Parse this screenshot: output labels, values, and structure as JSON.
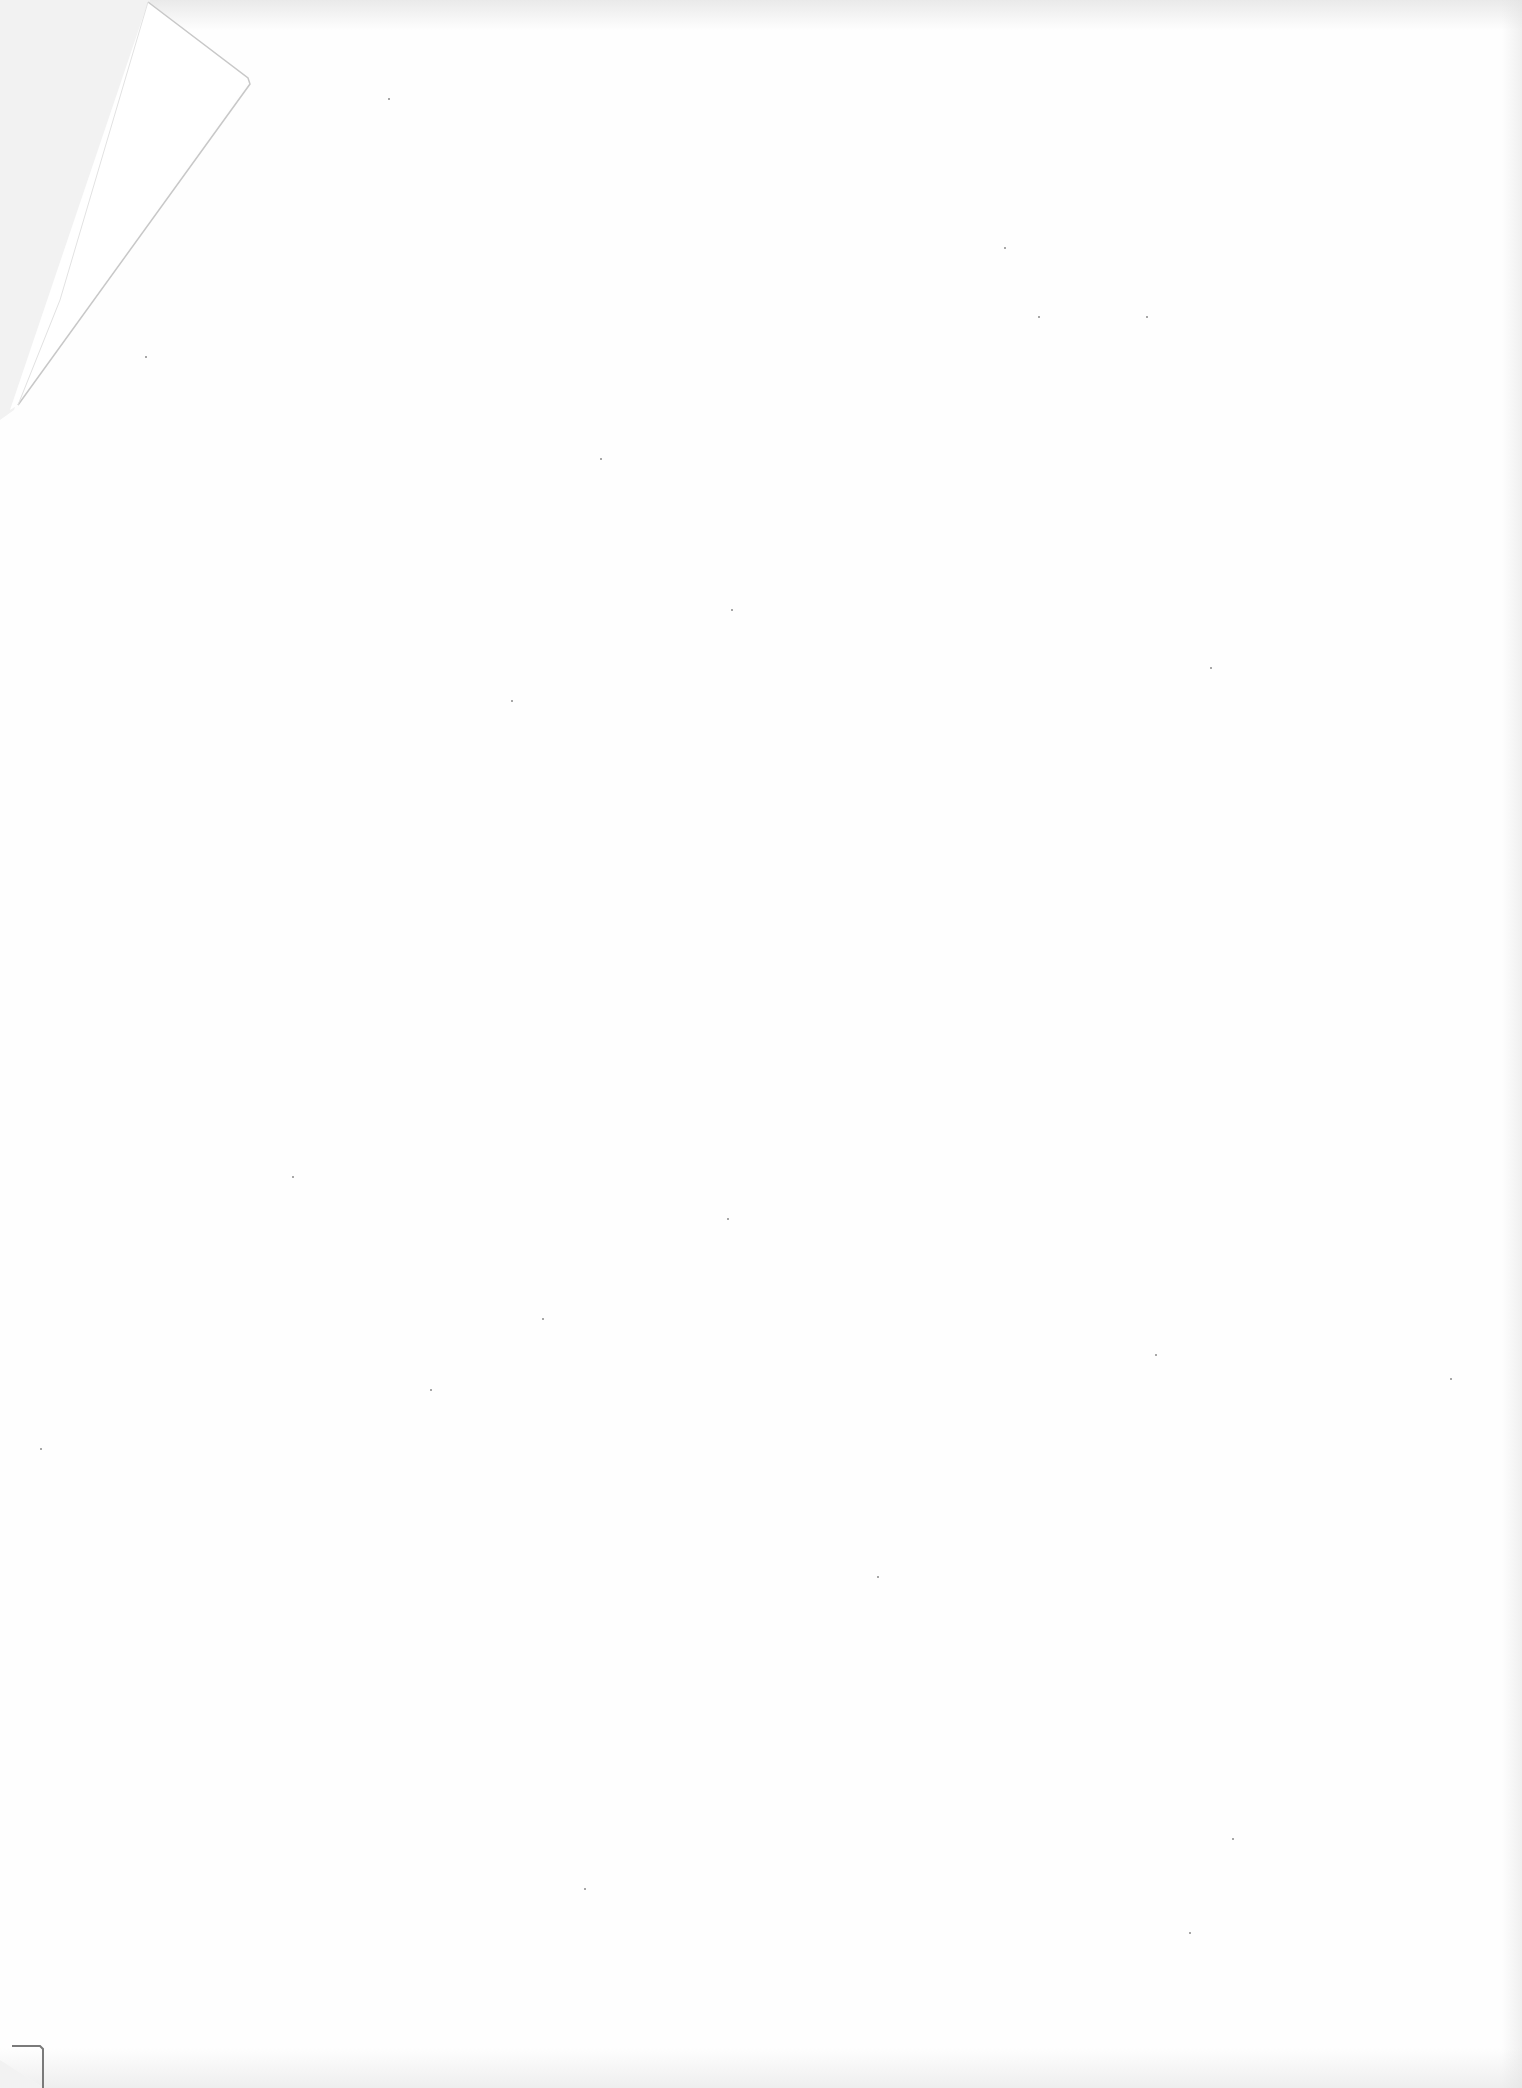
{
  "document": {
    "page_type": "blank scanned page",
    "text": "",
    "features": {
      "folded_corner": "top-left",
      "corner_mark": "bottom-left"
    },
    "colors": {
      "paper": "#fefefe",
      "background": "#f2f2f2",
      "fold_line": "#c8c8c8",
      "corner_mark": "#7a7a7a"
    }
  }
}
